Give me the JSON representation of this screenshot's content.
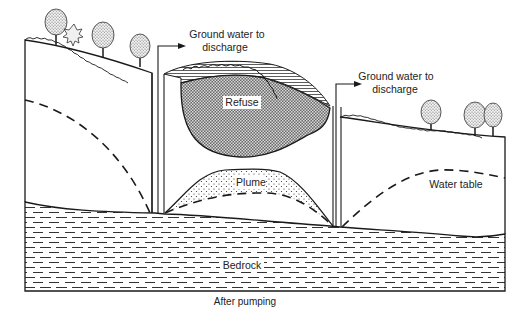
{
  "diagram": {
    "caption": "After pumping",
    "labels": {
      "discharge_left_line1": "Ground water to",
      "discharge_left_line2": "discharge",
      "discharge_right_line1": "Ground water to",
      "discharge_right_line2": "discharge",
      "refuse": "Refuse",
      "plume": "Plume",
      "water_table": "Water table",
      "bedrock": "Bedrock"
    },
    "colors": {
      "line": "#1a1a1a",
      "background": "#ffffff"
    }
  }
}
